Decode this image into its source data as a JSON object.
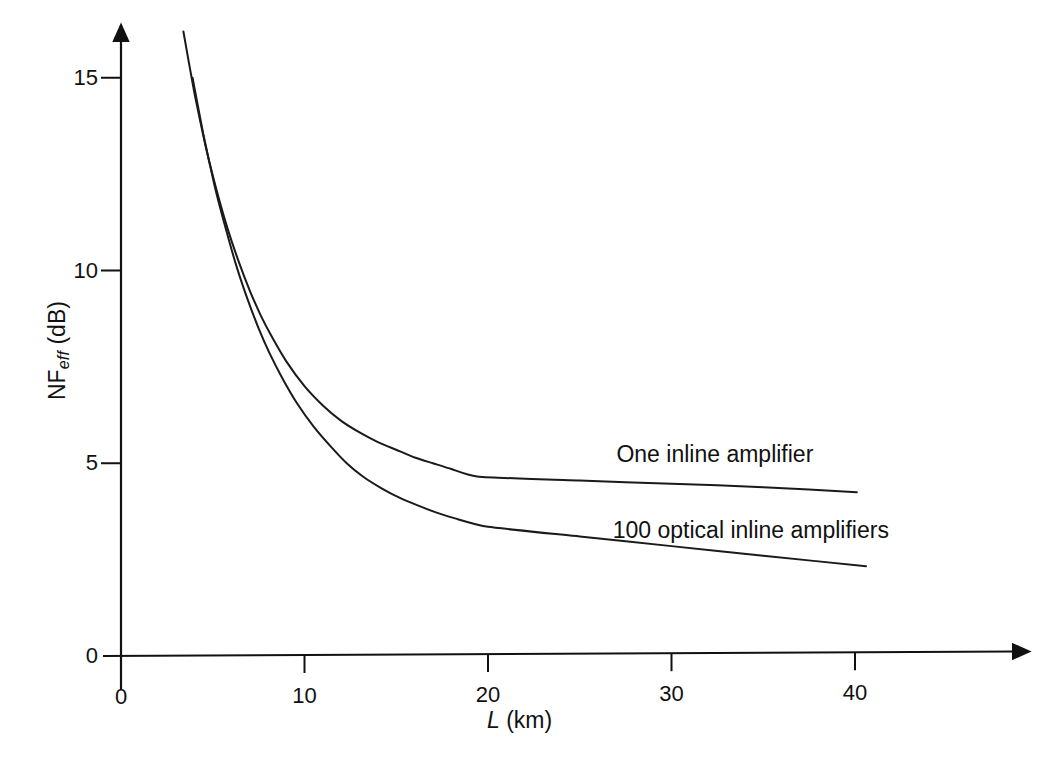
{
  "chart_data": {
    "type": "line",
    "title": "",
    "subtitle": "",
    "xlabel": "L (km)",
    "xlabel_italic_part": "L",
    "xlabel_rest": " (km)",
    "ylabel": "NFeff (dB)",
    "ylabel_main": "NF",
    "ylabel_sub": "eff",
    "ylabel_unit": " (dB)",
    "xlim": [
      0,
      45
    ],
    "ylim": [
      0,
      16.5
    ],
    "xticks": [
      0,
      10,
      20,
      30,
      40
    ],
    "yticks": [
      0,
      5,
      10,
      15
    ],
    "xtick_labels": [
      "0",
      "10",
      "20",
      "30",
      "40"
    ],
    "ytick_labels": [
      "0",
      "5",
      "10",
      "15"
    ],
    "grid": false,
    "legend_position": "inline-annotations",
    "axis_arrows": true,
    "line_color": "#1a1a1a",
    "series": [
      {
        "name": "One inline amplifier",
        "label": "One inline amplifier",
        "label_x": 27.0,
        "label_y": 5.15,
        "x": [
          3.4,
          4.0,
          4.6,
          5.2,
          5.8,
          6.4,
          7.0,
          7.6,
          8.2,
          9.0,
          10.0,
          11.0,
          12.0,
          13.0,
          14.0,
          15.0,
          16.0,
          17.0,
          18.0,
          19.5,
          25.0,
          30.0,
          35.0,
          40.1
        ],
        "y": [
          16.2,
          14.6,
          13.25,
          12.1,
          11.1,
          10.25,
          9.5,
          8.85,
          8.3,
          7.65,
          7.0,
          6.5,
          6.1,
          5.8,
          5.55,
          5.35,
          5.15,
          5.0,
          4.85,
          4.65,
          4.55,
          4.47,
          4.38,
          4.25
        ]
      },
      {
        "name": "100 optical inline amplifiers",
        "label": "100 optical inline amplifiers",
        "label_x": 26.8,
        "label_y": 3.2,
        "x": [
          3.9,
          4.5,
          5.1,
          5.7,
          6.3,
          6.9,
          7.5,
          8.1,
          8.8,
          9.6,
          10.5,
          11.4,
          12.3,
          13.2,
          14.2,
          15.2,
          16.2,
          17.2,
          18.2,
          20.0,
          25.0,
          30.0,
          35.0,
          40.6
        ],
        "y": [
          15.0,
          13.5,
          12.2,
          11.1,
          10.1,
          9.25,
          8.5,
          7.85,
          7.2,
          6.55,
          5.95,
          5.45,
          5.0,
          4.65,
          4.35,
          4.1,
          3.9,
          3.72,
          3.57,
          3.35,
          3.1,
          2.85,
          2.6,
          2.33
        ]
      }
    ]
  },
  "axes_pixels": {
    "x0_px": 121,
    "y0_px": 656,
    "x_per_unit": 18.35,
    "y_per_unit": 38.55,
    "x_axis_end_px": 1026,
    "y_axis_top_px": 26
  }
}
